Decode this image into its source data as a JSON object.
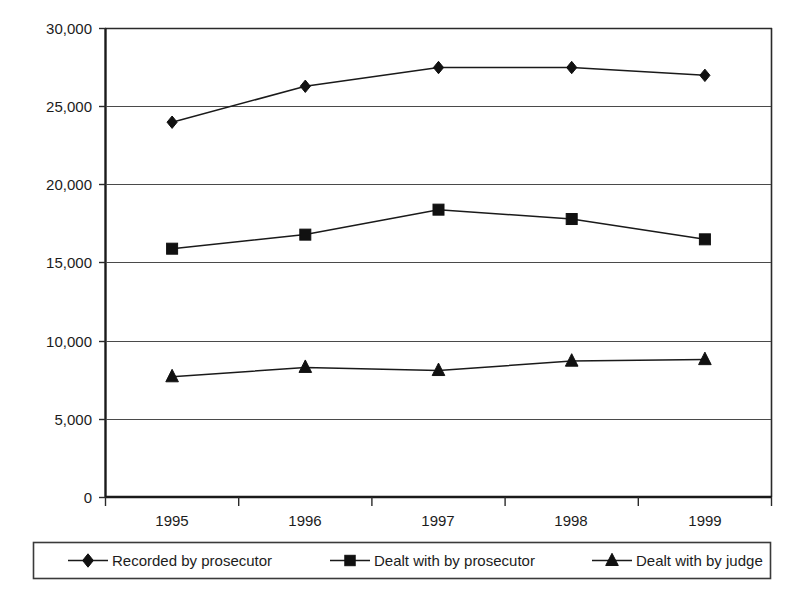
{
  "chart_data": {
    "type": "line",
    "title": "",
    "xlabel": "",
    "ylabel": "",
    "categories": [
      "1995",
      "1996",
      "1997",
      "1998",
      "1999"
    ],
    "ylim": [
      0,
      30000
    ],
    "ytick_labels": [
      "30,000",
      "25,000",
      "20,000",
      "15,000",
      "10,000",
      "5,000",
      "0"
    ],
    "ytick_values": [
      30000,
      25000,
      20000,
      15000,
      10000,
      5000,
      0
    ],
    "grid": "horizontal",
    "legend_position": "bottom",
    "series": [
      {
        "name": "Recorded by prosecutor",
        "marker": "diamond",
        "values": [
          24000,
          26300,
          27500,
          27500,
          27000
        ]
      },
      {
        "name": "Dealt with by prosecutor",
        "marker": "square",
        "values": [
          15900,
          16800,
          18400,
          17800,
          16500
        ]
      },
      {
        "name": "Dealt with by judge",
        "marker": "triangle",
        "values": [
          7700,
          8300,
          8100,
          8700,
          8800
        ]
      }
    ]
  },
  "colors": {
    "line": "#1a1a1a",
    "marker": "#111111",
    "grid": "#4a4a4a",
    "axis": "#1a1a1a",
    "background": "#ffffff"
  }
}
